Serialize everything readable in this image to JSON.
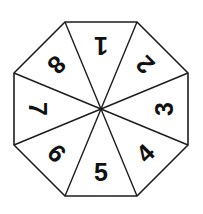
{
  "figure": {
    "name": "numbered-octagon-spinner",
    "shape": "octagon",
    "sector_count": 8,
    "background_color": "#ffffff",
    "line_color": "#1d1d1d",
    "text_color": "#111111"
  },
  "geometry": {
    "center_x": 101,
    "center_y": 109,
    "circumradius": 94,
    "rotation_offset_deg": 22.5,
    "label_radius": 63,
    "vertices": [
      {
        "x": 65.0,
        "y": 22.0
      },
      {
        "x": 137.0,
        "y": 22.0
      },
      {
        "x": 188.0,
        "y": 73.0
      },
      {
        "x": 188.0,
        "y": 145.0
      },
      {
        "x": 137.0,
        "y": 196.0
      },
      {
        "x": 65.0,
        "y": 196.0
      },
      {
        "x": 14.0,
        "y": 145.0
      },
      {
        "x": 14.0,
        "y": 73.0
      }
    ]
  },
  "sectors": [
    {
      "label": "1",
      "position": "top",
      "angle_deg": 0,
      "rotation_deg": 180,
      "label_x": 101,
      "label_y": 46
    },
    {
      "label": "2",
      "position": "top-right",
      "angle_deg": 45,
      "rotation_deg": 225,
      "label_x": 145,
      "label_y": 65
    },
    {
      "label": "3",
      "position": "right",
      "angle_deg": 90,
      "rotation_deg": 270,
      "label_x": 164,
      "label_y": 109
    },
    {
      "label": "4",
      "position": "bottom-right",
      "angle_deg": 135,
      "rotation_deg": 315,
      "label_x": 145,
      "label_y": 153
    },
    {
      "label": "5",
      "position": "bottom",
      "angle_deg": 180,
      "rotation_deg": 0,
      "label_x": 101,
      "label_y": 172
    },
    {
      "label": "6",
      "position": "bottom-left",
      "angle_deg": 225,
      "rotation_deg": 45,
      "label_x": 57,
      "label_y": 153
    },
    {
      "label": "7",
      "position": "left",
      "angle_deg": 270,
      "rotation_deg": 90,
      "label_x": 38,
      "label_y": 109
    },
    {
      "label": "8",
      "position": "top-left",
      "angle_deg": 315,
      "rotation_deg": 135,
      "label_x": 57,
      "label_y": 65
    }
  ]
}
